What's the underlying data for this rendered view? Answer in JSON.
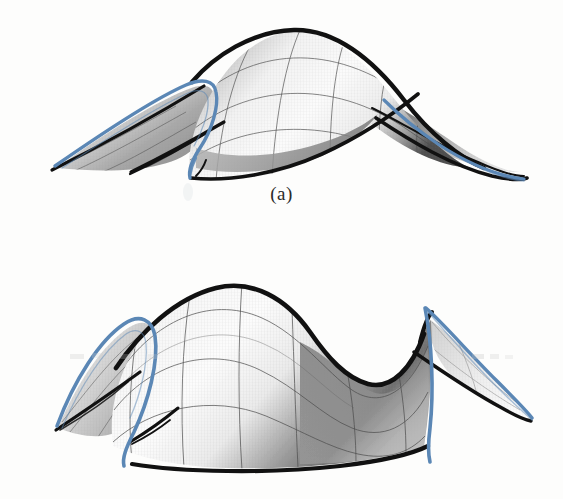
{
  "document": {
    "type": "scanned-figure-plate",
    "background_color": "#fdfdfc",
    "width": 563,
    "height": 499
  },
  "palette": {
    "fold_curve_blue": "#5b87b5",
    "fold_curve_blue_dark": "#3f6f9e",
    "silhouette_black": "#111111",
    "mesh_line": "#555555",
    "surface_light": "#fbfbfb",
    "surface_mid": "#d8d8d8",
    "surface_dark": "#6e6e6e",
    "caption_color": "#2a2a2a"
  },
  "figures": [
    {
      "id": "figure-a",
      "caption": "(a)",
      "description": "Shaded wireframe rendering of a smooth surface with a cusp/swallowtail fold; black silhouette outline, blue fold curve, quadrilateral mesh.",
      "curve_color": "#5b87b5",
      "outline_color": "#111111",
      "mesh_color": "#555555",
      "mesh_u_lines": 5,
      "mesh_v_lines": 4,
      "cusp_points": 2
    },
    {
      "id": "figure-b",
      "caption": "(b)",
      "description": "Shaded wireframe rendering of a saddle-like surface with two lateral fold wings; black silhouette outline, blue fold curve, quadrilateral mesh.",
      "curve_color": "#5b87b5",
      "outline_color": "#111111",
      "mesh_color": "#555555",
      "mesh_u_lines": 6,
      "mesh_v_lines": 4,
      "cusp_points": 2
    }
  ],
  "captions": {
    "a": "(a)",
    "b": "(b)"
  }
}
